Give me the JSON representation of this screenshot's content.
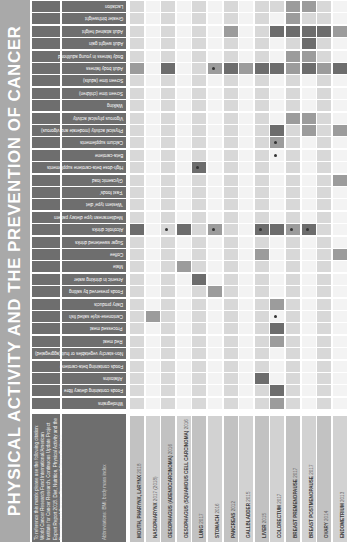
{
  "title": "PHYSICAL ACTIVITY AND THE PREVENTION OF CANCER",
  "info": {
    "text": "To reference this matrix please use the following citation: World Cancer Research Fund International/American Institute for Cancer Research. Continuous Update Project Expert Report 2018. Diet, Nutrition, Physical Activity and the Prevention of Cancer: Summary of Strong Evidence. Available at wcrf.org/cancertrends accessed on DD MM YYYY",
    "note": "Abbreviations: BMI, body mass index"
  },
  "colors": {
    "title_strip": "#a9a9a9",
    "header_dark": "#6e6e6e",
    "convincing_decrease": "#6b6b6b",
    "probable": "#9a9a9a",
    "limited": "#d6d6d6",
    "none": "#efefef"
  },
  "cancers": [
    {
      "label": "MOUTH, PHARYNX, LARYNX",
      "year": "2018"
    },
    {
      "label": "NASOPHARYNX",
      "year": "2017 (2018)"
    },
    {
      "label": "OESOPHAGUS (ADENOCARCINOMA)",
      "year": "2016"
    },
    {
      "label": "OESOPHAGUS (SQUAMOUS CELL CARCINOMA)",
      "year": "2016"
    },
    {
      "label": "LUNG",
      "year": "2017"
    },
    {
      "label": "STOMACH",
      "year": "2016"
    },
    {
      "label": "PANCREAS",
      "year": "2012"
    },
    {
      "label": "GALLBLADDER",
      "year": "2015"
    },
    {
      "label": "LIVER",
      "year": "2015"
    },
    {
      "label": "COLORECTUM",
      "year": "2017"
    },
    {
      "label": "BREAST PREMENOPAUSE",
      "year": "2017"
    },
    {
      "label": "BREAST POSTMENOPAUSE",
      "year": "2017"
    },
    {
      "label": "OVARY",
      "year": "2014"
    },
    {
      "label": "ENDOMETRIUM",
      "year": "2013"
    }
  ],
  "exposures": [
    "Lactation",
    "Greater birthweight",
    "Adult attained height",
    "Adult weight gain",
    "Body fatness in young adulthood",
    "Adult body fatness",
    "Screen time (adults)",
    "Screen time (children)",
    "Walking",
    "Vigorous physical activity",
    "Physical activity (moderate and vigorous)",
    "Calcium supplements",
    "Beta-carotene",
    "High-dose beta-carotene supplements",
    "Glycaemic load",
    "'Fast foods'",
    "'Western type' diet",
    "Mediterranean type dietary pattern",
    "Alcoholic drinks",
    "Sugar sweetened drinks",
    "Coffee",
    "Mate",
    "Arsenic in drinking water",
    "Foods preserved by salting",
    "Dairy products",
    "Cantonese-style salted fish",
    "Processed meat",
    "Red meat",
    "Non-starchy vegetables or fruit (aggregated)",
    "Foods containing beta-carotene",
    "Aflatoxins",
    "Foods containing dietary fibre",
    "Wholegrains"
  ],
  "grid": [
    [
      1,
      0,
      1,
      0,
      1,
      0,
      1,
      0,
      1,
      1,
      3,
      3,
      1,
      0
    ],
    [
      1,
      0,
      1,
      0,
      1,
      0,
      1,
      0,
      1,
      0,
      3,
      1,
      1,
      0
    ],
    [
      1,
      0,
      1,
      0,
      1,
      0,
      3,
      0,
      1,
      4,
      4,
      4,
      4,
      3
    ],
    [
      1,
      0,
      1,
      0,
      1,
      0,
      1,
      0,
      1,
      0,
      1,
      4,
      1,
      0
    ],
    [
      1,
      0,
      1,
      0,
      1,
      0,
      1,
      0,
      1,
      0,
      3,
      3,
      1,
      0
    ],
    [
      3,
      0,
      4,
      0,
      1,
      3,
      4,
      3,
      4,
      4,
      3,
      4,
      3,
      4
    ],
    [
      1,
      0,
      1,
      0,
      1,
      0,
      1,
      0,
      1,
      0,
      1,
      0,
      1,
      0
    ],
    [
      1,
      0,
      1,
      0,
      1,
      0,
      1,
      0,
      1,
      0,
      1,
      0,
      1,
      0
    ],
    [
      1,
      0,
      1,
      0,
      1,
      0,
      1,
      0,
      1,
      0,
      1,
      0,
      1,
      0
    ],
    [
      1,
      0,
      1,
      0,
      1,
      0,
      1,
      0,
      1,
      0,
      3,
      3,
      1,
      0
    ],
    [
      1,
      0,
      1,
      0,
      1,
      0,
      1,
      0,
      1,
      4,
      1,
      3,
      1,
      3
    ],
    [
      1,
      0,
      1,
      0,
      1,
      0,
      1,
      0,
      1,
      3,
      1,
      0,
      1,
      0
    ],
    [
      1,
      0,
      1,
      0,
      1,
      0,
      1,
      0,
      1,
      0,
      1,
      0,
      1,
      0
    ],
    [
      1,
      0,
      1,
      0,
      4,
      0,
      1,
      0,
      1,
      0,
      1,
      0,
      1,
      0
    ],
    [
      1,
      0,
      1,
      0,
      1,
      0,
      1,
      0,
      1,
      0,
      1,
      0,
      1,
      3
    ],
    [
      1,
      0,
      1,
      0,
      1,
      0,
      1,
      0,
      1,
      0,
      1,
      0,
      1,
      0
    ],
    [
      1,
      0,
      1,
      0,
      1,
      0,
      1,
      0,
      1,
      0,
      1,
      0,
      1,
      0
    ],
    [
      1,
      0,
      1,
      0,
      1,
      0,
      1,
      0,
      1,
      0,
      1,
      0,
      1,
      0
    ],
    [
      4,
      0,
      1,
      4,
      1,
      3,
      1,
      0,
      4,
      4,
      3,
      4,
      1,
      0
    ],
    [
      1,
      0,
      1,
      0,
      1,
      0,
      1,
      0,
      1,
      0,
      1,
      0,
      1,
      0
    ],
    [
      1,
      0,
      1,
      0,
      1,
      0,
      1,
      0,
      3,
      0,
      1,
      0,
      1,
      3
    ],
    [
      1,
      0,
      1,
      3,
      1,
      0,
      1,
      0,
      1,
      0,
      1,
      0,
      1,
      0
    ],
    [
      1,
      0,
      1,
      0,
      4,
      0,
      1,
      0,
      1,
      0,
      1,
      0,
      1,
      0
    ],
    [
      1,
      0,
      1,
      0,
      1,
      3,
      1,
      0,
      1,
      0,
      1,
      0,
      1,
      0
    ],
    [
      1,
      0,
      1,
      0,
      1,
      0,
      1,
      0,
      1,
      3,
      1,
      0,
      1,
      0
    ],
    [
      1,
      3,
      1,
      0,
      1,
      0,
      1,
      0,
      1,
      0,
      1,
      0,
      1,
      0
    ],
    [
      1,
      0,
      1,
      0,
      1,
      0,
      1,
      0,
      1,
      4,
      1,
      0,
      1,
      0
    ],
    [
      1,
      0,
      1,
      0,
      1,
      0,
      1,
      0,
      1,
      3,
      1,
      0,
      1,
      0
    ],
    [
      1,
      0,
      1,
      0,
      1,
      0,
      1,
      0,
      1,
      0,
      1,
      0,
      1,
      0
    ],
    [
      1,
      0,
      1,
      0,
      1,
      0,
      1,
      0,
      1,
      0,
      1,
      0,
      1,
      0
    ],
    [
      1,
      0,
      1,
      0,
      1,
      0,
      1,
      0,
      4,
      0,
      1,
      0,
      1,
      0
    ],
    [
      1,
      0,
      1,
      0,
      1,
      0,
      1,
      0,
      1,
      4,
      1,
      0,
      1,
      0
    ],
    [
      1,
      0,
      1,
      0,
      1,
      0,
      1,
      0,
      1,
      3,
      1,
      0,
      1,
      0
    ]
  ],
  "marks": [
    [
      5,
      5
    ],
    [
      18,
      2
    ],
    [
      18,
      5
    ],
    [
      18,
      8
    ],
    [
      18,
      10
    ],
    [
      18,
      11
    ],
    [
      13,
      4
    ],
    [
      11,
      9
    ],
    [
      12,
      9
    ],
    [
      25,
      9
    ]
  ]
}
